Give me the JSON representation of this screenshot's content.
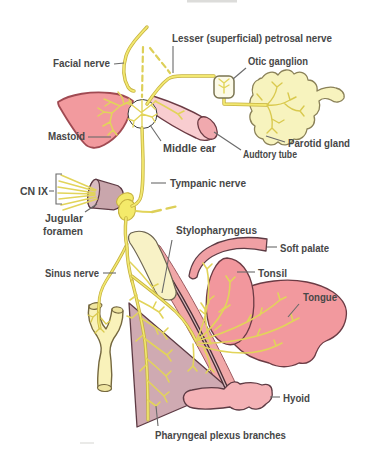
{
  "figure": {
    "labels": {
      "facial_nerve": "Facial nerve",
      "lesser_petrosal": "Lesser (superficial) petrosal nerve",
      "otic_ganglion": "Otic ganglion",
      "mastoid": "Mastoid",
      "middle_ear": "Middle ear",
      "auditory_tube": "Audtory tube",
      "parotid_gland": "Parotid gland",
      "tympanic_nerve": "Tympanic nerve",
      "cn_ix": "CN IX",
      "jugular_foramen_line1": "Jugular",
      "jugular_foramen_line2": "foramen",
      "stylopharyngeus": "Stylopharyngeus",
      "sinus_nerve": "Sinus nerve",
      "soft_palate": "Soft palate",
      "tonsil": "Tonsil",
      "tongue": "Tongue",
      "hyoid": "Hyoid",
      "pharyngeal_plexus": "Pharyngeal plexus branches"
    },
    "colors": {
      "nerve_yellow": "#f2e871",
      "nerve_outline": "#c6b23f",
      "gland_yellow": "#f7f3be",
      "muscle_pink": "#f2999e",
      "pale_pink": "#f8cdd0",
      "mauve_muscle": "#cfaab2",
      "foramen_mauve": "#c9a6ac",
      "outline_maroon": "#5d3b44",
      "label_text": "#474747",
      "leader_gray": "#6a6a6a",
      "background": "#ffffff"
    }
  }
}
